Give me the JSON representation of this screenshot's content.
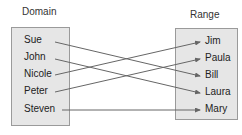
{
  "diagram": {
    "domain": {
      "title": "Domain",
      "items": [
        "Sue",
        "John",
        "Nicole",
        "Peter",
        "Steven"
      ]
    },
    "range": {
      "title": "Range",
      "items": [
        "Jim",
        "Paula",
        "Bill",
        "Laura",
        "Mary"
      ]
    },
    "mappings": [
      {
        "from": "Sue",
        "to": "Bill"
      },
      {
        "from": "John",
        "to": "Laura"
      },
      {
        "from": "Nicole",
        "to": "Jim"
      },
      {
        "from": "Peter",
        "to": "Paula"
      },
      {
        "from": "Steven",
        "to": "Mary"
      }
    ],
    "colors": {
      "box_fill": "#e6e6e6",
      "box_border": "#9a9a9a",
      "arrow": "#666666"
    }
  }
}
